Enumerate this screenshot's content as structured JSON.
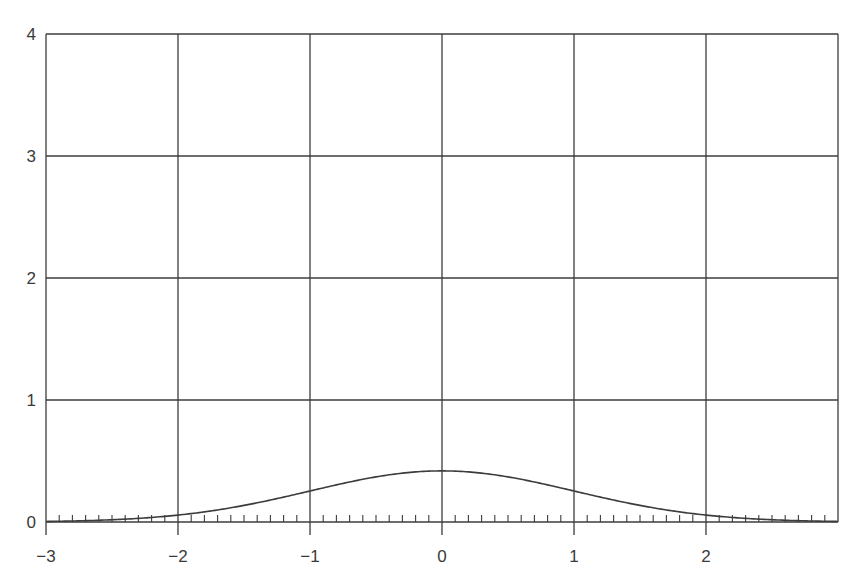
{
  "chart_data": {
    "type": "line",
    "title": "",
    "xlabel": "",
    "ylabel": "",
    "xlim": [
      -3,
      3
    ],
    "ylim": [
      0,
      4
    ],
    "grid": true,
    "legend": null,
    "x_ticks": [
      -3,
      -2,
      -1,
      0,
      1,
      2
    ],
    "x_tick_labels": [
      "−3",
      "−2",
      "−1",
      "0",
      "1",
      "2"
    ],
    "y_ticks": [
      0,
      1,
      2,
      3,
      4
    ],
    "y_tick_labels": [
      "0",
      "1",
      "2",
      "3",
      "4"
    ],
    "minor_x_ticks_step": 0.1,
    "series": [
      {
        "name": "standard normal density",
        "x": [
          -3.0,
          -2.5,
          -2.0,
          -1.5,
          -1.0,
          -0.5,
          0.0,
          0.5,
          1.0,
          1.5,
          2.0,
          2.5,
          3.0
        ],
        "values": [
          0.004,
          0.018,
          0.054,
          0.13,
          0.242,
          0.352,
          0.399,
          0.352,
          0.242,
          0.13,
          0.054,
          0.018,
          0.004
        ]
      }
    ],
    "colors": {
      "grid": "#3c3c3c",
      "curve": "#3c3c3c",
      "text": "#3a3a3a",
      "background": "#ffffff"
    }
  }
}
